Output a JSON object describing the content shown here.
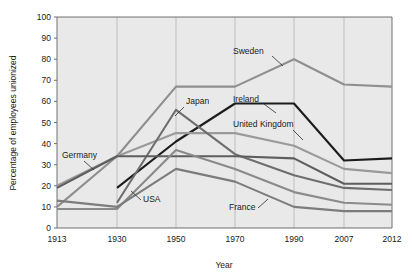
{
  "chart_data": {
    "type": "line",
    "title": "",
    "xlabel": "Year",
    "ylabel": "Percentage of employees unionized",
    "x": [
      1913,
      1930,
      1950,
      1970,
      1990,
      2007,
      2012
    ],
    "xtick_labels": [
      "1913",
      "1930",
      "1950",
      "1970",
      "1990",
      "2007",
      "2012"
    ],
    "ytick_labels": [
      "0",
      "10",
      "20",
      "30",
      "40",
      "50",
      "60",
      "70",
      "80",
      "90",
      "100"
    ],
    "ylim": [
      0,
      100
    ],
    "grid": "vertical",
    "legend": "inline-annotations",
    "series": [
      {
        "name": "Sweden",
        "color": "#8f8f8f",
        "width": 2.1,
        "values": [
          10,
          34,
          67,
          67,
          80,
          68,
          67
        ]
      },
      {
        "name": "Ireland",
        "color": "#1c1c1c",
        "width": 2.1,
        "values": [
          null,
          19,
          41,
          59,
          59,
          32,
          33
        ]
      },
      {
        "name": "United Kingdom",
        "color": "#9a9a9a",
        "width": 2.1,
        "values": [
          20,
          34,
          45,
          45,
          39,
          28,
          26
        ]
      },
      {
        "name": "Japan",
        "color": "#6e6e6e",
        "width": 2.1,
        "values": [
          null,
          12,
          56,
          35,
          25,
          19,
          18
        ]
      },
      {
        "name": "Germany",
        "color": "#5e5e5e",
        "width": 2.1,
        "values": [
          19,
          34,
          34,
          34,
          33,
          21,
          21
        ]
      },
      {
        "name": "USA",
        "color": "#8a8a8a",
        "width": 2.1,
        "values": [
          9,
          9,
          37,
          28,
          17,
          12,
          11
        ]
      },
      {
        "name": "France",
        "color": "#7c7c7c",
        "width": 2.1,
        "values": [
          13,
          10,
          28,
          22,
          10,
          8,
          8
        ]
      }
    ],
    "annotations": [
      {
        "label": "Sweden",
        "x": 233,
        "y": 54,
        "leader": [
          [
            272,
            56
          ],
          [
            283,
            66
          ]
        ]
      },
      {
        "label": "Ireland",
        "x": 233,
        "y": 102,
        "leader": [
          [
            264,
            104
          ],
          [
            276,
            113
          ]
        ]
      },
      {
        "label": "United Kingdom",
        "x": 233,
        "y": 127,
        "leader": [
          [
            293,
            130
          ],
          [
            303,
            140
          ]
        ]
      },
      {
        "label": "Japan",
        "x": 186,
        "y": 104,
        "leader": [
          [
            184,
            107
          ],
          [
            175,
            116
          ]
        ]
      },
      {
        "label": "Germany",
        "x": 62,
        "y": 158,
        "leader": [
          [
            84,
            161
          ],
          [
            94,
            170
          ]
        ]
      },
      {
        "label": "USA",
        "x": 143,
        "y": 202,
        "leader": [
          [
            141,
            200
          ],
          [
            131,
            191
          ]
        ]
      },
      {
        "label": "France",
        "x": 229,
        "y": 210,
        "leader": [
          [
            258,
            208
          ],
          [
            268,
            199
          ]
        ]
      }
    ]
  },
  "axes": {
    "plot_bg": "#e9e9e9",
    "frame_color": "#707070",
    "grid_color": "#b9b9b9"
  }
}
